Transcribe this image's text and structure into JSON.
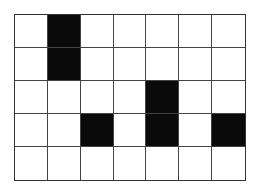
{
  "grid": {
    "rows": 5,
    "cols": 7,
    "filled_color": "#0a0a0a",
    "empty_color": "#ffffff",
    "cells": [
      [
        0,
        1,
        0,
        0,
        0,
        0,
        0
      ],
      [
        0,
        1,
        0,
        0,
        0,
        0,
        0
      ],
      [
        0,
        0,
        0,
        0,
        1,
        0,
        0
      ],
      [
        0,
        0,
        1,
        0,
        1,
        0,
        1
      ],
      [
        0,
        0,
        0,
        0,
        0,
        0,
        0
      ]
    ]
  }
}
